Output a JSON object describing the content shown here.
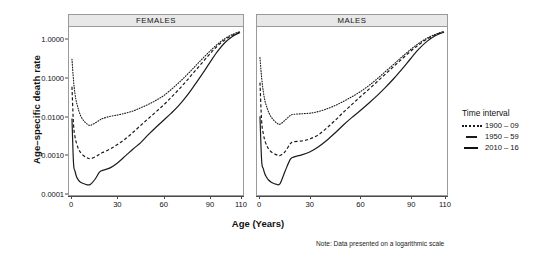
{
  "figure": {
    "y_axis_title": "Age–specific death rate",
    "x_axis_title": "Age (Years)",
    "note": "Note: Data presented on a logarithmic scale"
  },
  "legend": {
    "title": "Time interval",
    "items": [
      {
        "label": "1900 – 09",
        "style": "dotted"
      },
      {
        "label": "1950 – 59",
        "style": "dashed"
      },
      {
        "label": "2010 – 16",
        "style": "solid"
      }
    ]
  },
  "panels": [
    {
      "key": "females",
      "title": "FEMALES"
    },
    {
      "key": "males",
      "title": "MALES"
    }
  ],
  "axes": {
    "y_ticks": [
      "1.0000",
      "0.1000",
      "0.0100",
      "0.0010",
      "0.0001"
    ],
    "x_ticks": [
      "0",
      "30",
      "60",
      "90",
      "110"
    ]
  },
  "chart_data": {
    "type": "line",
    "title": "",
    "xlabel": "Age (Years)",
    "ylabel": "Age–specific death rate",
    "xlim": [
      0,
      110
    ],
    "ylim": [
      5e-05,
      1.0
    ],
    "yscale": "log",
    "grid": false,
    "legend_position": "right",
    "legend_title": "Time interval",
    "note": "Note: Data presented on a logarithmic scale",
    "panels": [
      {
        "name": "FEMALES",
        "x": [
          0,
          1,
          2,
          3,
          4,
          5,
          7,
          10,
          12,
          15,
          18,
          20,
          25,
          30,
          35,
          40,
          45,
          50,
          55,
          60,
          65,
          70,
          75,
          80,
          85,
          90,
          95,
          100,
          105,
          110
        ],
        "series": [
          {
            "name": "1900 – 09",
            "style": "dotted",
            "values": [
              0.145,
              0.042,
              0.018,
              0.011,
              0.0078,
              0.0058,
              0.004,
              0.003,
              0.0028,
              0.0032,
              0.0038,
              0.0042,
              0.0048,
              0.0052,
              0.0058,
              0.0066,
              0.008,
              0.0098,
              0.0125,
              0.0165,
              0.024,
              0.036,
              0.056,
              0.09,
              0.145,
              0.23,
              0.35,
              0.5,
              0.64,
              0.76
            ]
          },
          {
            "name": "1950 – 59",
            "style": "dashed",
            "values": [
              0.028,
              0.003,
              0.0014,
              0.00095,
              0.00072,
              0.0006,
              0.00048,
              0.0004,
              0.00038,
              0.00042,
              0.0005,
              0.00055,
              0.00068,
              0.0009,
              0.00125,
              0.00185,
              0.0028,
              0.0042,
              0.0063,
              0.0095,
              0.015,
              0.024,
              0.04,
              0.068,
              0.115,
              0.195,
              0.315,
              0.46,
              0.61,
              0.74
            ]
          },
          {
            "name": "2010 – 16",
            "style": "solid",
            "values": [
              0.0042,
              0.0003,
              0.00018,
              0.00013,
              0.00011,
              9.8e-05,
              8.8e-05,
              8e-05,
              8.2e-05,
              0.00011,
              0.00017,
              0.00019,
              0.00022,
              0.0003,
              0.00045,
              0.00068,
              0.001,
              0.0016,
              0.0025,
              0.0038,
              0.0058,
              0.0092,
              0.016,
              0.03,
              0.058,
              0.115,
              0.225,
              0.39,
              0.57,
              0.72
            ]
          }
        ]
      },
      {
        "name": "MALES",
        "x": [
          0,
          1,
          2,
          3,
          4,
          5,
          7,
          10,
          12,
          15,
          18,
          20,
          25,
          30,
          35,
          40,
          45,
          50,
          55,
          60,
          65,
          70,
          75,
          80,
          85,
          90,
          95,
          100,
          105,
          110
        ],
        "series": [
          {
            "name": "1900 – 09",
            "style": "dotted",
            "values": [
              0.16,
              0.048,
              0.021,
              0.012,
              0.0086,
              0.0064,
              0.0044,
              0.0032,
              0.003,
              0.0038,
              0.005,
              0.0054,
              0.0056,
              0.0058,
              0.0064,
              0.0075,
              0.0092,
              0.0118,
              0.0155,
              0.021,
              0.03,
              0.045,
              0.07,
              0.108,
              0.17,
              0.26,
              0.38,
              0.52,
              0.65,
              0.77
            ]
          },
          {
            "name": "1950 – 59",
            "style": "dashed",
            "values": [
              0.036,
              0.0036,
              0.0017,
              0.0011,
              0.00085,
              0.0007,
              0.00056,
              0.00048,
              0.00046,
              0.00058,
              0.00092,
              0.00105,
              0.0011,
              0.00125,
              0.0016,
              0.0024,
              0.0038,
              0.0062,
              0.0098,
              0.0155,
              0.024,
              0.038,
              0.06,
              0.095,
              0.15,
              0.235,
              0.35,
              0.49,
              0.63,
              0.755
            ]
          },
          {
            "name": "2010 – 16",
            "style": "solid",
            "values": [
              0.0048,
              0.00034,
              0.00021,
              0.00015,
              0.000125,
              0.000108,
              9.2e-05,
              8.2e-05,
              8.6e-05,
              0.00018,
              0.00036,
              0.00042,
              0.00048,
              0.00058,
              0.00078,
              0.00115,
              0.0018,
              0.0029,
              0.0045,
              0.0068,
              0.0105,
              0.0165,
              0.027,
              0.046,
              0.082,
              0.15,
              0.27,
              0.43,
              0.6,
              0.735
            ]
          }
        ]
      }
    ]
  }
}
